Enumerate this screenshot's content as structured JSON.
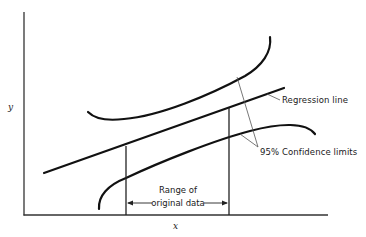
{
  "diagram": {
    "title": "",
    "axes": {
      "x_label": "x",
      "y_label": "y"
    },
    "annotations": {
      "regression_line": "Regression line",
      "confidence_limits": "95% Confidence limits",
      "range_line1": "Range of",
      "range_line2": "original data"
    },
    "elements": [
      {
        "id": "regression-line",
        "type": "line",
        "label": "Regression line"
      },
      {
        "id": "upper-confidence-limit",
        "type": "curve",
        "label": "95% Confidence limits"
      },
      {
        "id": "lower-confidence-limit",
        "type": "curve",
        "label": "95% Confidence limits"
      },
      {
        "id": "range-left-boundary",
        "type": "vertical-line"
      },
      {
        "id": "range-right-boundary",
        "type": "vertical-line"
      },
      {
        "id": "range-arrow",
        "type": "double-arrow",
        "label": "Range of original data"
      }
    ],
    "colors": {
      "ink": "#1a1a1a",
      "leader": "#555555",
      "background": "#ffffff"
    }
  }
}
